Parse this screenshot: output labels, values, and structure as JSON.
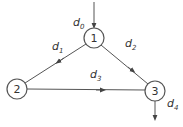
{
  "diagram": {
    "nodes": [
      {
        "id": "1",
        "label": "1",
        "cx": 94,
        "cy": 38
      },
      {
        "id": "2",
        "label": "2",
        "cx": 17,
        "cy": 89
      },
      {
        "id": "3",
        "label": "3",
        "cx": 155,
        "cy": 91
      }
    ],
    "edges": [
      {
        "from": "1",
        "to": "2",
        "label": "d",
        "sub": "1"
      },
      {
        "from": "1",
        "to": "3",
        "label": "d",
        "sub": "2"
      },
      {
        "from": "2",
        "to": "3",
        "label": "d",
        "sub": "3"
      }
    ],
    "external": [
      {
        "label": "d",
        "sub": "0",
        "direction": "in",
        "node": "1"
      },
      {
        "label": "d",
        "sub": "4",
        "direction": "out",
        "node": "3"
      }
    ],
    "stroke_color": "#555555"
  }
}
